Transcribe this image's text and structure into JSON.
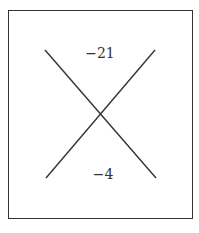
{
  "diagram": {
    "type": "cross-diagram",
    "top_value": "−21",
    "bottom_value": "−4",
    "colors": {
      "line": "#333333",
      "text": "#333333",
      "background": "#ffffff"
    }
  }
}
